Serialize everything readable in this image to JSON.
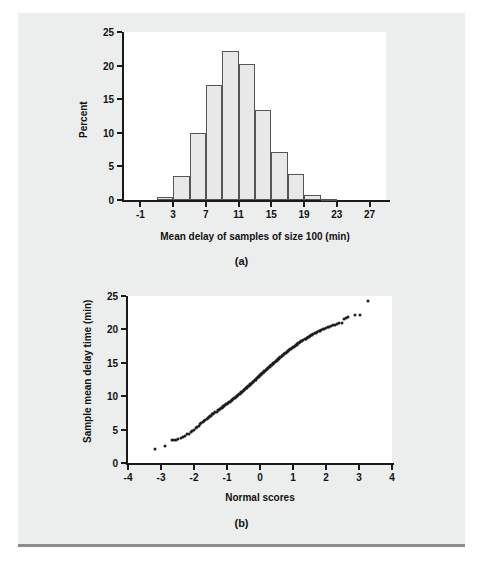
{
  "figure": {
    "panel_a_caption": "(a)",
    "panel_b_caption": "(b)"
  },
  "chart_data": [
    {
      "type": "bar",
      "title": "",
      "panel": "(a)",
      "xlabel": "Mean delay of samples of size 100 (min)",
      "ylabel": "Percent",
      "xlim": [
        -3,
        29
      ],
      "ylim": [
        0,
        25
      ],
      "grid": false,
      "legend": "none",
      "bin_width": 2,
      "xticks": [
        -1,
        3,
        7,
        11,
        15,
        19,
        23,
        27
      ],
      "xtick_labels": [
        "-1",
        "3",
        "7",
        "11",
        "15",
        "19",
        "23",
        "27"
      ],
      "yticks": [
        0,
        5,
        10,
        15,
        20,
        25
      ],
      "ytick_labels": [
        "0",
        "5",
        "10",
        "15",
        "20",
        "25"
      ],
      "bin_left_edges": [
        1,
        3,
        5,
        7,
        9,
        11,
        13,
        15,
        17,
        19,
        21,
        23
      ],
      "bin_centers": [
        2,
        4,
        6,
        8,
        10,
        12,
        14,
        16,
        18,
        20,
        22,
        24
      ],
      "categories": [
        "1-3",
        "3-5",
        "5-7",
        "7-9",
        "9-11",
        "11-13",
        "13-15",
        "15-17",
        "17-19",
        "19-21",
        "21-23",
        "23-25"
      ],
      "values": [
        0.5,
        3.6,
        9.9,
        17.1,
        22.1,
        20.3,
        13.4,
        7.1,
        3.8,
        0.8,
        0.2,
        0.0
      ]
    },
    {
      "type": "scatter",
      "title": "",
      "panel": "(b)",
      "xlabel": "Normal scores",
      "ylabel": "Sample mean delay time (min)",
      "xlim": [
        -4,
        4
      ],
      "ylim": [
        0,
        25
      ],
      "grid": false,
      "legend": "none",
      "xticks": [
        -4,
        -3,
        -2,
        -1,
        0,
        1,
        2,
        3,
        4
      ],
      "xtick_labels": [
        "-4",
        "-3",
        "-2",
        "-1",
        "0",
        "1",
        "2",
        "3",
        "4"
      ],
      "yticks": [
        0,
        5,
        10,
        15,
        20,
        25
      ],
      "ytick_labels": [
        "0",
        "5",
        "10",
        "15",
        "20",
        "25"
      ],
      "series": [
        {
          "name": "sample mean delay time",
          "points": [
            [
              -3.18,
              2.1
            ],
            [
              -2.88,
              2.6
            ],
            [
              -2.68,
              3.4
            ],
            [
              -2.62,
              3.45
            ],
            [
              -2.56,
              3.5
            ],
            [
              -2.48,
              3.6
            ],
            [
              -2.4,
              3.7
            ],
            [
              -2.33,
              3.9
            ],
            [
              -2.27,
              4.1
            ],
            [
              -2.21,
              4.3
            ],
            [
              -2.15,
              4.4
            ],
            [
              -2.1,
              4.6
            ],
            [
              -2.05,
              4.8
            ],
            [
              -2.0,
              5.0
            ],
            [
              -1.95,
              5.2
            ],
            [
              -1.9,
              5.4
            ],
            [
              -1.86,
              5.6
            ],
            [
              -1.82,
              5.8
            ],
            [
              -1.78,
              6.0
            ],
            [
              -1.74,
              6.1
            ],
            [
              -1.7,
              6.3
            ],
            [
              -1.66,
              6.4
            ],
            [
              -1.62,
              6.6
            ],
            [
              -1.58,
              6.7
            ],
            [
              -1.55,
              6.9
            ],
            [
              -1.51,
              7.0
            ],
            [
              -1.48,
              7.1
            ],
            [
              -1.44,
              7.3
            ],
            [
              -1.41,
              7.4
            ],
            [
              -1.38,
              7.5
            ],
            [
              -1.35,
              7.6
            ],
            [
              -1.31,
              7.7
            ],
            [
              -1.28,
              7.9
            ],
            [
              -1.25,
              8.0
            ],
            [
              -1.22,
              8.1
            ],
            [
              -1.19,
              8.2
            ],
            [
              -1.16,
              8.3
            ],
            [
              -1.13,
              8.4
            ],
            [
              -1.11,
              8.5
            ],
            [
              -1.08,
              8.6
            ],
            [
              -1.05,
              8.7
            ],
            [
              -1.02,
              8.8
            ],
            [
              -0.99,
              8.9
            ],
            [
              -0.97,
              9.0
            ],
            [
              -0.94,
              9.1
            ],
            [
              -0.91,
              9.2
            ],
            [
              -0.89,
              9.3
            ],
            [
              -0.86,
              9.4
            ],
            [
              -0.84,
              9.5
            ],
            [
              -0.81,
              9.6
            ],
            [
              -0.79,
              9.7
            ],
            [
              -0.76,
              9.8
            ],
            [
              -0.74,
              9.9
            ],
            [
              -0.71,
              10.0
            ],
            [
              -0.69,
              10.1
            ],
            [
              -0.66,
              10.2
            ],
            [
              -0.64,
              10.3
            ],
            [
              -0.61,
              10.4
            ],
            [
              -0.59,
              10.5
            ],
            [
              -0.57,
              10.6
            ],
            [
              -0.54,
              10.7
            ],
            [
              -0.52,
              10.8
            ],
            [
              -0.5,
              10.9
            ],
            [
              -0.47,
              11.0
            ],
            [
              -0.45,
              11.1
            ],
            [
              -0.43,
              11.2
            ],
            [
              -0.4,
              11.3
            ],
            [
              -0.38,
              11.4
            ],
            [
              -0.36,
              11.5
            ],
            [
              -0.33,
              11.6
            ],
            [
              -0.31,
              11.7
            ],
            [
              -0.29,
              11.8
            ],
            [
              -0.27,
              11.9
            ],
            [
              -0.24,
              12.0
            ],
            [
              -0.22,
              12.1
            ],
            [
              -0.2,
              12.2
            ],
            [
              -0.18,
              12.3
            ],
            [
              -0.15,
              12.4
            ],
            [
              -0.13,
              12.5
            ],
            [
              -0.11,
              12.6
            ],
            [
              -0.09,
              12.7
            ],
            [
              -0.07,
              12.8
            ],
            [
              -0.04,
              12.9
            ],
            [
              -0.02,
              13.0
            ],
            [
              0.0,
              13.1
            ],
            [
              0.02,
              13.2
            ],
            [
              0.04,
              13.3
            ],
            [
              0.07,
              13.4
            ],
            [
              0.09,
              13.5
            ],
            [
              0.11,
              13.6
            ],
            [
              0.13,
              13.7
            ],
            [
              0.15,
              13.8
            ],
            [
              0.18,
              13.9
            ],
            [
              0.2,
              14.0
            ],
            [
              0.22,
              14.1
            ],
            [
              0.24,
              14.2
            ],
            [
              0.27,
              14.3
            ],
            [
              0.29,
              14.4
            ],
            [
              0.31,
              14.5
            ],
            [
              0.33,
              14.6
            ],
            [
              0.36,
              14.7
            ],
            [
              0.38,
              14.8
            ],
            [
              0.4,
              14.9
            ],
            [
              0.43,
              15.0
            ],
            [
              0.45,
              15.1
            ],
            [
              0.47,
              15.2
            ],
            [
              0.5,
              15.3
            ],
            [
              0.52,
              15.4
            ],
            [
              0.54,
              15.5
            ],
            [
              0.57,
              15.6
            ],
            [
              0.59,
              15.7
            ],
            [
              0.61,
              15.8
            ],
            [
              0.64,
              15.9
            ],
            [
              0.66,
              16.0
            ],
            [
              0.69,
              16.1
            ],
            [
              0.71,
              16.2
            ],
            [
              0.74,
              16.3
            ],
            [
              0.76,
              16.4
            ],
            [
              0.79,
              16.5
            ],
            [
              0.81,
              16.6
            ],
            [
              0.84,
              16.7
            ],
            [
              0.86,
              16.8
            ],
            [
              0.89,
              16.9
            ],
            [
              0.91,
              17.0
            ],
            [
              0.94,
              17.1
            ],
            [
              0.97,
              17.2
            ],
            [
              0.99,
              17.3
            ],
            [
              1.02,
              17.4
            ],
            [
              1.05,
              17.5
            ],
            [
              1.08,
              17.6
            ],
            [
              1.11,
              17.7
            ],
            [
              1.13,
              17.8
            ],
            [
              1.16,
              17.9
            ],
            [
              1.19,
              18.0
            ],
            [
              1.22,
              18.1
            ],
            [
              1.25,
              18.2
            ],
            [
              1.28,
              18.3
            ],
            [
              1.31,
              18.4
            ],
            [
              1.35,
              18.5
            ],
            [
              1.38,
              18.6
            ],
            [
              1.41,
              18.7
            ],
            [
              1.44,
              18.8
            ],
            [
              1.48,
              18.9
            ],
            [
              1.51,
              19.0
            ],
            [
              1.55,
              19.1
            ],
            [
              1.58,
              19.2
            ],
            [
              1.62,
              19.3
            ],
            [
              1.66,
              19.4
            ],
            [
              1.7,
              19.5
            ],
            [
              1.74,
              19.6
            ],
            [
              1.78,
              19.7
            ],
            [
              1.82,
              19.8
            ],
            [
              1.86,
              19.9
            ],
            [
              1.9,
              20.0
            ],
            [
              1.95,
              20.1
            ],
            [
              2.0,
              20.2
            ],
            [
              2.05,
              20.3
            ],
            [
              2.1,
              20.4
            ],
            [
              2.15,
              20.5
            ],
            [
              2.21,
              20.6
            ],
            [
              2.27,
              20.7
            ],
            [
              2.33,
              20.8
            ],
            [
              2.4,
              20.9
            ],
            [
              2.48,
              21.0
            ],
            [
              2.56,
              21.6
            ],
            [
              2.62,
              21.7
            ],
            [
              2.68,
              21.9
            ],
            [
              2.88,
              22.1
            ],
            [
              3.03,
              22.2
            ],
            [
              3.28,
              24.2
            ]
          ]
        }
      ]
    }
  ]
}
